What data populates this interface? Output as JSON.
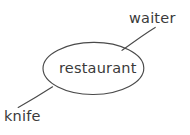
{
  "diagram": {
    "type": "mind-map",
    "background_color": "#ffffff",
    "stroke_color": "#4a4a4a",
    "text_color": "#3a3a3a",
    "central_node": {
      "label": "restaurant",
      "shape": "ellipse"
    },
    "branches": [
      {
        "label": "waiter",
        "position": "top-right"
      },
      {
        "label": "knife",
        "position": "bottom-left"
      }
    ]
  }
}
